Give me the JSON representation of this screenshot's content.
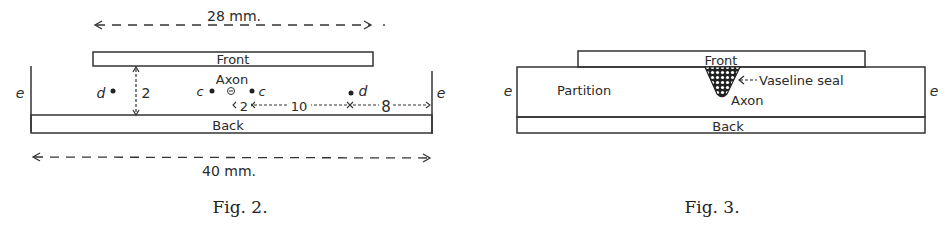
{
  "figures": [
    {
      "caption": "Fig. 2.",
      "labels": {
        "top_dimension": "28 mm.",
        "bottom_dimension": "40 mm.",
        "front": "Front",
        "back": "Back",
        "axon": "Axon",
        "electrode_e_left": "e",
        "electrode_e_right": "e",
        "electrode_d_left": "d",
        "electrode_d_right": "d",
        "electrode_c_left": "c",
        "electrode_c_right": "c",
        "gap": "2",
        "spacing_c": "2",
        "spacing_cd": "10",
        "spacing_de": "8"
      }
    },
    {
      "caption": "Fig. 3.",
      "labels": {
        "front": "Front",
        "back": "Back",
        "partition": "Partition",
        "vaseline": "Vaseline seal",
        "axon": "Axon",
        "electrode_e_left": "e",
        "electrode_e_right": "e"
      }
    }
  ]
}
